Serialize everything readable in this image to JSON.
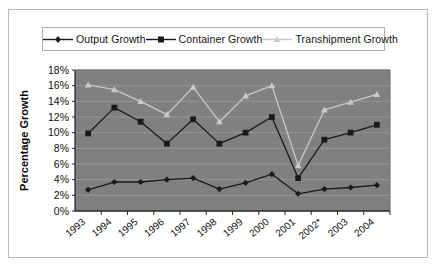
{
  "chart_data": {
    "type": "line",
    "title": "",
    "xlabel": "",
    "ylabel": "Percentage Growth",
    "ylim": [
      0,
      18
    ],
    "ytick_step": 2,
    "grid": true,
    "legend_position": "top",
    "categories": [
      "1993",
      "1994",
      "1995",
      "1996",
      "1997",
      "1998",
      "1999",
      "2000",
      "2001",
      "2002*",
      "2003",
      "2004"
    ],
    "ytick_labels": [
      "18%",
      "16%",
      "14%",
      "12%",
      "10%",
      "8%",
      "6%",
      "4%",
      "2%",
      "0%"
    ],
    "ytick_values": [
      18,
      16,
      14,
      12,
      10,
      8,
      6,
      4,
      2,
      0
    ],
    "series": [
      {
        "name": "Output Growth",
        "marker": "diamond",
        "color": "#1a1a1a",
        "values": [
          2.7,
          3.7,
          3.7,
          4.0,
          4.2,
          2.8,
          3.6,
          4.7,
          2.2,
          2.8,
          3.0,
          3.3
        ]
      },
      {
        "name": "Container Growth",
        "marker": "square",
        "color": "#1a1a1a",
        "values": [
          9.9,
          13.2,
          11.4,
          8.6,
          11.7,
          8.6,
          10.0,
          12.0,
          4.2,
          9.1,
          10.0,
          11.0
        ]
      },
      {
        "name": "Transhipment Growth",
        "marker": "triangle",
        "color": "#c9c9c9",
        "values": [
          16.1,
          15.5,
          14.0,
          12.3,
          15.8,
          11.4,
          14.7,
          16.0,
          5.8,
          12.9,
          13.9,
          14.9
        ]
      }
    ]
  },
  "colors": {
    "plot_background": "#808080",
    "gridline": "#9a9a9a",
    "axis": "#2a2a2a",
    "page_background": "#ffffff",
    "frame_border": "#b9b9b9"
  }
}
